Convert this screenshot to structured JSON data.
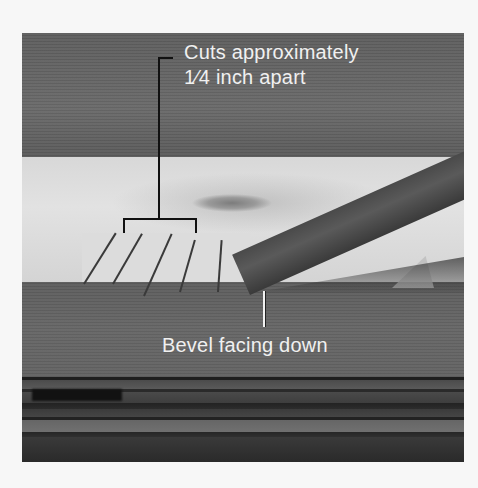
{
  "figure": {
    "colors": {
      "page_background": "#f7f7f7",
      "label_text": "#f0f0f0",
      "callout_line_dark": "#111111",
      "callout_line_light": "#f2f2f2"
    }
  },
  "callouts": {
    "cuts": {
      "line1": "Cuts approximately",
      "line2": "1⁄4 inch apart"
    },
    "bevel": {
      "label": "Bevel facing down"
    }
  }
}
